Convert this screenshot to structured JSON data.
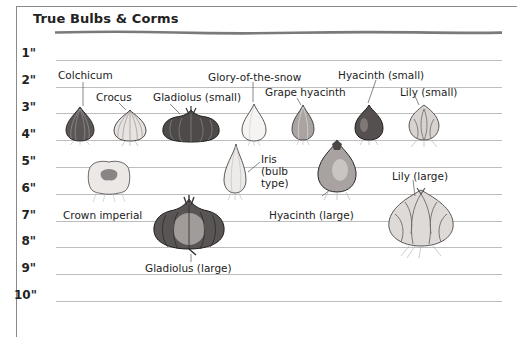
{
  "title": "True Bulbs & Corms",
  "ruler": {
    "unit": "inches",
    "marks": [
      "1\"",
      "2\"",
      "3\"",
      "4\"",
      "5\"",
      "6\"",
      "7\"",
      "8\"",
      "9\"",
      "10\""
    ]
  },
  "bulbs": [
    {
      "name": "Colchicum"
    },
    {
      "name": "Crocus"
    },
    {
      "name": "Gladiolus (small)"
    },
    {
      "name": "Glory-of-the-snow"
    },
    {
      "name": "Grape hyacinth"
    },
    {
      "name": "Hyacinth (small)"
    },
    {
      "name": "Lily (small)"
    },
    {
      "name": "Crown imperial"
    },
    {
      "name": "Iris (bulb type)",
      "lines": [
        "Iris",
        "(bulb",
        "type)"
      ]
    },
    {
      "name": "Hyacinth (large)"
    },
    {
      "name": "Lily (large)"
    },
    {
      "name": "Gladiolus (large)"
    }
  ],
  "colors": {
    "line": "#bdbdbd",
    "text": "#222222",
    "frame": "#8a8a8a"
  }
}
